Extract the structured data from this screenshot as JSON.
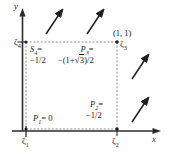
{
  "figure": {
    "axes": {
      "x_label": "x",
      "y_label": "y"
    },
    "corner_coordinate_label": "(1, 1)",
    "tick_labels": {
      "zeta1": "ζ",
      "zeta1_sub": "1",
      "zeta2": "ζ",
      "zeta2_sub": "2",
      "zeta3": "ζ",
      "zeta3_sub": "3",
      "zeta4": "ζ",
      "zeta4_sub": "4"
    },
    "node_values": {
      "p1": {
        "name": "P",
        "sub": "1",
        "value": "= 0"
      },
      "p2": {
        "name": "P",
        "sub": "2",
        "value": "=",
        "value2": "−1/2"
      },
      "p3": {
        "name": "P",
        "sub": "3",
        "value": "=",
        "value2_prefix": "−(1+",
        "value2_radical": "3",
        "value2_suffix": ")/2"
      },
      "s4": {
        "name": "S",
        "sub": "4",
        "value": "=",
        "value2": "−1/2"
      }
    },
    "vectors": [
      {
        "id": "vector-top-left",
        "tip_x": 62,
        "tip_y": 10,
        "tail_x": 46,
        "tail_y": 34
      },
      {
        "id": "vector-top-right",
        "tip_x": 103,
        "tip_y": 10,
        "tail_x": 87,
        "tail_y": 34
      },
      {
        "id": "vector-right-upper",
        "tip_x": 150,
        "tip_y": 55,
        "tail_x": 134,
        "tail_y": 79
      },
      {
        "id": "vector-right-lower",
        "tip_x": 150,
        "tip_y": 98,
        "tail_x": 134,
        "tail_y": 122
      }
    ],
    "square": {
      "left": 26,
      "right": 117,
      "top": 42,
      "bottom": 129
    },
    "colors": {
      "ink": "#1a1a1a",
      "dashed": "#8c8c8c",
      "background": "#ffffff"
    }
  }
}
